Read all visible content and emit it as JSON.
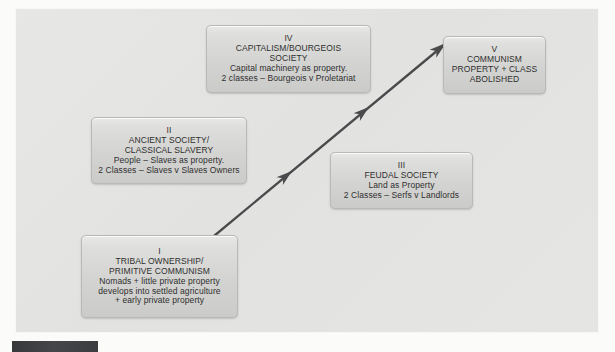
{
  "diagram": {
    "background_color": "#e4e4e2",
    "page_color": "#fbfbfa",
    "box_fill_color": "#d4d4d2",
    "box_border_color": "#b9b9b7",
    "arrow_color": "#4a4a4c",
    "accent_bar_color": "#3f4042"
  },
  "nodes": [
    {
      "id": "tribal",
      "numeral": "I",
      "title_lines": [
        "TRIBAL OWNERSHIP/",
        "PRIMITIVE COMMUNISM"
      ],
      "detail_lines": [
        "Nomads + little private property",
        "develops into settled agriculture",
        "+ early private property"
      ]
    },
    {
      "id": "ancient",
      "numeral": "II",
      "title_lines": [
        "ANCIENT SOCIETY/",
        "CLASSICAL SLAVERY"
      ],
      "detail_lines": [
        "People – Slaves as property.",
        "2 Classes – Slaves v Slaves Owners"
      ]
    },
    {
      "id": "feudal",
      "numeral": "III",
      "title_lines": [
        "FEUDAL SOCIETY"
      ],
      "detail_lines": [
        "Land as Property",
        "2 Classes – Serfs v Landlords"
      ]
    },
    {
      "id": "capitalism",
      "numeral": "IV",
      "title_lines": [
        "CAPITALISM/BOURGEOIS",
        "SOCIETY"
      ],
      "detail_lines": [
        "Capital machinery as property.",
        "2 classes – Bourgeois v Proletariat"
      ]
    },
    {
      "id": "communism",
      "numeral": "V",
      "title_lines": [
        "COMMUNISM",
        "PROPERTY + CLASS",
        "ABOLISHED"
      ],
      "detail_lines": []
    }
  ],
  "connector": {
    "name": "progression-arrow",
    "from_node": "tribal",
    "to_node": "communism",
    "style": "straight-diagonal-multi-arrowhead",
    "start": {
      "x": 214,
      "y": 236
    },
    "end": {
      "x": 446,
      "y": 44
    },
    "intermediate_arrowheads": 2
  }
}
